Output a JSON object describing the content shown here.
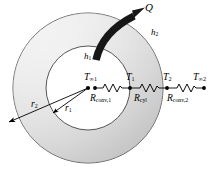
{
  "figure": {
    "name": "cylindrical-wall-thermal-resistance-network",
    "geometry": {
      "center": [
        88,
        88
      ],
      "outer_radius": 75,
      "inner_radius": 42
    },
    "colors": {
      "annulus_light": "#f2f2f2",
      "annulus_mid": "#d8d8d8",
      "annulus_dark": "#b9b9b9",
      "stroke": "#3a3a3a",
      "arrow": "#1a1a1a",
      "inner_fill": "#ffffff",
      "text": "#000000"
    }
  },
  "labels": {
    "heat_flow": {
      "symbol": "Q",
      "accent": "dot",
      "text": "Q"
    },
    "h_inner": {
      "base": "h",
      "sub": "1"
    },
    "h_outer": {
      "base": "h",
      "sub": "2"
    },
    "r_inner": {
      "base": "r",
      "sub": "1"
    },
    "r_outer": {
      "base": "r",
      "sub": "2"
    }
  },
  "network": {
    "nodes": [
      {
        "id": "T_inf1",
        "base": "T",
        "sub": "∞1",
        "x": 95,
        "y": 88
      },
      {
        "id": "T_1",
        "base": "T",
        "sub": "1",
        "x": 130,
        "y": 88
      },
      {
        "id": "T_2",
        "base": "T",
        "sub": "2",
        "x": 167,
        "y": 88
      },
      {
        "id": "T_inf2",
        "base": "T",
        "sub": "∞2",
        "x": 204,
        "y": 88
      }
    ],
    "resistors": [
      {
        "id": "R_conv1",
        "base": "R",
        "sub": "conv,1",
        "x1": 95,
        "x2": 130
      },
      {
        "id": "R_cyl",
        "base": "R",
        "sub": "cyl",
        "x1": 130,
        "x2": 167
      },
      {
        "id": "R_conv2",
        "base": "R",
        "sub": "conv,2",
        "x1": 167,
        "x2": 204
      }
    ]
  }
}
